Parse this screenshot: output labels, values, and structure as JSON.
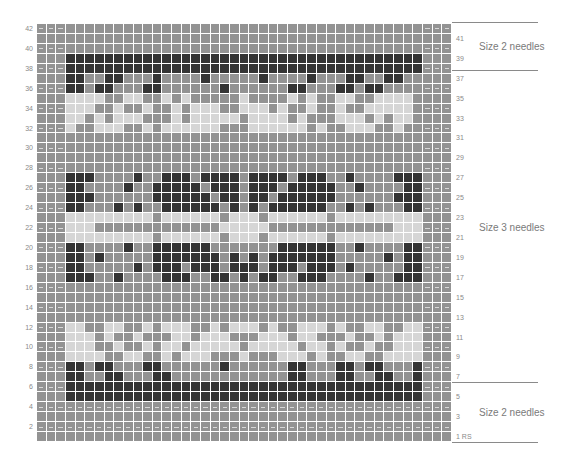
{
  "chart_title": "Fair Isle knitting chart",
  "colors": {
    "medium": "#939393",
    "light": "#d6d6d6",
    "dark": "#343434",
    "grid": "#ffffff",
    "label": "#8a8a8a"
  },
  "grid": {
    "cols": 43,
    "rows": 42,
    "legend_codes": {
      "M": "medium gray stitch",
      "L": "light gray stitch",
      "D": "dark stitch",
      "E": "edge stitch (medium)",
      "-": "purl/dash marker"
    },
    "row_data": [
      {
        "row": 42,
        "cells": "EEEMMMMMMMMMMMMMMMMMMMMMMMMMMMMMMMMMMMMMEEE",
        "dash_edges": true
      },
      {
        "row": 41,
        "cells": "MMMMMMMMMMMMMMMMMMMMMMMMMMMMMMMMMMMMMMMMMMM",
        "dash_edges": false
      },
      {
        "row": 40,
        "cells": "EEEMMMMMMMMMMMMMMMMMMMMMMMMMMMMMMMMMMMMMEEE",
        "dash_edges": true
      },
      {
        "row": 39,
        "cells": "MMMDDDDDDDDDDDDDDDDDDDDDDDDDDDDDDDDDDDDDMMM",
        "dash_edges": false
      },
      {
        "row": 38,
        "cells": "EEEDDDDDDDDDDDDDDDDDDDDDDDDDDDDDDDDDDDDDEEE",
        "dash_edges": true
      },
      {
        "row": 37,
        "cells": "MMMDDMMDDMMMDMMMMDMMMMMDMMMMDMMMDDMMDDMMMMM",
        "dash_edges": false
      },
      {
        "row": 36,
        "cells": "EEEDDMDDMMMDDMMMMMMDMMMMMMDDMMMDDMDDMMMEEEM",
        "dash_edges": true
      },
      {
        "row": 35,
        "cells": "MMMLLLLMMLLMMLMLMMMMMLMMMMLMLMMLLMMLLLLMMMM",
        "dash_edges": false
      },
      {
        "row": 34,
        "cells": "EEELLLMMLMMLMMLMLLLMMLLLMLMMLMMLMMLLLLLMEEE",
        "dash_edges": true
      },
      {
        "row": 33,
        "cells": "MMMLLMLMLLLMMMLMLLLLLMLLLLMLMMMLLLMLMLLMMMM",
        "dash_edges": false
      },
      {
        "row": 32,
        "cells": "EEELMMLLLMMLMLLLLLLMMMLLLLLLMLMMLLLMMLMMEEE",
        "dash_edges": true
      },
      {
        "row": 31,
        "cells": "MMMMMMMMMMMMMMMMMMMMMMMMMMMMMMMMMMMMMMMMMMM",
        "dash_edges": false
      },
      {
        "row": 30,
        "cells": "EEEMMMMMMMMMMMMMMMMMMMMMMMMMMMMMMMMMMMMMEEE",
        "dash_edges": true
      },
      {
        "row": 29,
        "cells": "MMMMMMMMMMMMMMMMMMMMMMMMMMMMMMMMMMMMMMMMMMM",
        "dash_edges": false
      },
      {
        "row": 28,
        "cells": "EEEMMMMMMMMMMMMMMMMMMMMMMMMMMMMMMMMMMMMMEEE",
        "dash_edges": true
      },
      {
        "row": 27,
        "cells": "MMMDDDMMMMDMMDDDMDDDDMDDDDMDDDMMDMMMMDDDMMM",
        "dash_edges": false
      },
      {
        "row": 26,
        "cells": "EEEDDMMMMDMMDDDDDMDDDMDDDMDDDDDMMDMMMMDDEEE",
        "dash_edges": true
      },
      {
        "row": 25,
        "cells": "MMMDDDMMMMMMDDDDDDMDDMDDMDDDDDDMMMMMMDDDMMM",
        "dash_edges": false
      },
      {
        "row": 24,
        "cells": "EEEDDMMMDMDMMDDDDDDMDMDMDDDDDDMMDMDMMMDDEEE",
        "dash_edges": true
      },
      {
        "row": 23,
        "cells": "MMMLLLLLLLLLMLLLLLLMLLLMLLLLLLMLLLLLLLLLMMM",
        "dash_edges": false
      },
      {
        "row": 22,
        "cells": "EEELLLMMMMMMMMMMMMMLLLLLMMMMMMMMMMMMMLLLEEE",
        "dash_edges": true
      },
      {
        "row": 21,
        "cells": "MMMLLLLLLLLLMLLLLLLMLLLMLLLLLLMLLLLLLLLLMMM",
        "dash_edges": false
      },
      {
        "row": 20,
        "cells": "EEEDDMMMMDMMDDDDDDMMMMMMMDDDDDDMMDMMMMDDEEE",
        "dash_edges": true
      },
      {
        "row": 19,
        "cells": "MMMDDMDMMMMMDDDDDDDMDMDMDDDDDDDMMMMMDMDDMMM",
        "dash_edges": false
      },
      {
        "row": 18,
        "cells": "EEEDDMMMMMDMDDDMDDDMDDDMDDDMDDDMDMMMMMDDEEE",
        "dash_edges": true
      },
      {
        "row": 17,
        "cells": "MMMDDDMMDMMMMDDDMMDDMDMDDMMDDDMMMMDMMDDDMMM",
        "dash_edges": false
      },
      {
        "row": 16,
        "cells": "EEEMMMMMMMMMMMMMMMMMMMMMMMMMMMMMMMMMMMMMEEE",
        "dash_edges": true
      },
      {
        "row": 15,
        "cells": "MMMMMMMMMMMMMMMMMMMMMMMMMMMMMMMMMMMMMMMMMMM",
        "dash_edges": false
      },
      {
        "row": 14,
        "cells": "EEEMMMMMMMMMMMMMMMMMMMMMMMMMMMMMMMMMMMMMEEE",
        "dash_edges": true
      },
      {
        "row": 13,
        "cells": "MMMMMMMMMMMMMMMMMMMMMMMMMMMMMMMMMMMMMMMMMMM",
        "dash_edges": false
      },
      {
        "row": 12,
        "cells": "EEELLMMLLMMLMLLLMMLMLLLMLMMLLLMLMMLLMMLLEEE",
        "dash_edges": true
      },
      {
        "row": 11,
        "cells": "MMMLLLMLMMLMMMLLMLLLMMMLLLMLLMMMLMMLMLLLMMM",
        "dash_edges": false
      },
      {
        "row": 10,
        "cells": "EEELLLMMLMMLMLLMLLLLLMLLLLLMLLMLMMLMMLLLEEE",
        "dash_edges": true
      },
      {
        "row": 9,
        "cells": "MMMLLLLMMLLMMLMLLLMMMLMMMLLLMLMMLLMMLLLLMMM",
        "dash_edges": false
      },
      {
        "row": 8,
        "cells": "EEEDDMDDMMMDDMMMMMMDMMMMMMDDMMMDDMDDMMMDEEE",
        "dash_edges": true
      },
      {
        "row": 7,
        "cells": "MMMDDMMDDMMMDDMMMMMMMMMMMMDDMMMDDMMDDMMDMMM",
        "dash_edges": false
      },
      {
        "row": 6,
        "cells": "EEEDDDDDDDDDDDDDDDDDDDDDDDDDDDDDDDDDDDDDEEE",
        "dash_edges": true
      },
      {
        "row": 5,
        "cells": "MMMDDDDDDDDDDDDDDDDDDDDDDDDDDDDDDDDDDDDDMMM",
        "dash_edges": false
      },
      {
        "row": 4,
        "cells": "EEEEEEEEEEEEEEEEEEEEEEEEEEEEEEEEEEEEEEEEEEE",
        "dash_edges": true,
        "dash_full": true
      },
      {
        "row": 3,
        "cells": "MMMMMMMMMMMMMMMMMMMMMMMMMMMMMMMMMMMMMMMMMMM",
        "dash_edges": false
      },
      {
        "row": 2,
        "cells": "EEEEEEEEEEEEEEEEEEEEEEEEEEEEEEEEEEEEEEEEEEE",
        "dash_edges": true,
        "dash_full": true
      },
      {
        "row": 1,
        "cells": "MMMMMMMMMMMMMMMMMMMMMMMMMMMMMMMMMMMMMMMMMMM",
        "dash_edges": false
      }
    ]
  },
  "row_labels_left": [
    "42",
    "40",
    "38",
    "36",
    "34",
    "32",
    "30",
    "28",
    "26",
    "24",
    "22",
    "20",
    "18",
    "16",
    "14",
    "12",
    "10",
    "8",
    "6",
    "4",
    "2"
  ],
  "row_labels_right": [
    "41",
    "39",
    "37",
    "35",
    "33",
    "31",
    "29",
    "27",
    "25",
    "23",
    "21",
    "19",
    "17",
    "15",
    "13",
    "11",
    "9",
    "7",
    "5",
    "3",
    "1 RS"
  ],
  "sections": [
    {
      "label": "Size 2 needles",
      "from_row": 38,
      "to_row": 42
    },
    {
      "label": "Size 3 needles",
      "from_row": 6,
      "to_row": 37
    },
    {
      "label": "Size 2 needles",
      "from_row": 1,
      "to_row": 5
    }
  ],
  "chart_data": {
    "type": "heatmap",
    "title": "",
    "xlabel": "",
    "ylabel": "Row number",
    "rows": 42,
    "cols": 43,
    "value_levels": [
      "medium gray",
      "light gray",
      "dark"
    ],
    "y_tick_labels_left": [
      "2",
      "4",
      "6",
      "8",
      "10",
      "12",
      "14",
      "16",
      "18",
      "20",
      "22",
      "24",
      "26",
      "28",
      "30",
      "32",
      "34",
      "36",
      "38",
      "40",
      "42"
    ],
    "y_tick_labels_right": [
      "1 RS",
      "3",
      "5",
      "7",
      "9",
      "11",
      "13",
      "15",
      "17",
      "19",
      "21",
      "23",
      "25",
      "27",
      "29",
      "31",
      "33",
      "35",
      "37",
      "39",
      "41"
    ],
    "annotations": [
      {
        "text": "Size 2 needles",
        "rows": "38-42"
      },
      {
        "text": "Size 3 needles",
        "rows": "6-37"
      },
      {
        "text": "Size 2 needles",
        "rows": "1-5"
      }
    ],
    "bands": [
      {
        "rows": "39-38",
        "description": "solid dark band"
      },
      {
        "rows": "37-32",
        "description": "dark/light motif band"
      },
      {
        "rows": "27-17",
        "description": "central dark block motif with light stripe rows 21-23"
      },
      {
        "rows": "12-7",
        "description": "light/dark motif band"
      },
      {
        "rows": "6-5",
        "description": "solid dark band"
      }
    ]
  }
}
